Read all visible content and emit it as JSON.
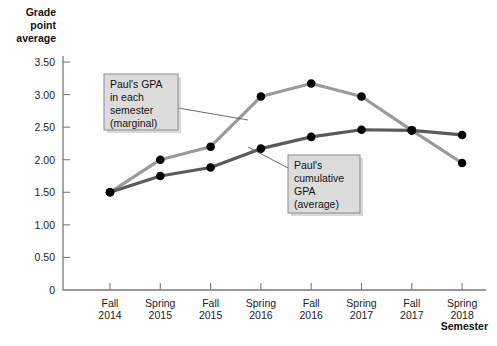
{
  "chart_data": {
    "type": "line",
    "title": "",
    "xlabel": "Semester",
    "ylabel": "Grade point average",
    "ylim": [
      0,
      3.5
    ],
    "yticks": [
      "0",
      "0.50",
      "1.00",
      "1.50",
      "2.00",
      "2.50",
      "3.00",
      "3.50"
    ],
    "ytick_values": [
      0,
      0.5,
      1.0,
      1.5,
      2.0,
      2.5,
      3.0,
      3.5
    ],
    "grid": false,
    "legend_position": "annotations",
    "categories": [
      "Fall 2014",
      "Spring 2015",
      "Fall 2015",
      "Spring 2016",
      "Fall 2016",
      "Spring 2017",
      "Fall 2017",
      "Spring 2018"
    ],
    "category_lines": [
      [
        "Fall",
        "2014"
      ],
      [
        "Spring",
        "2015"
      ],
      [
        "Fall",
        "2015"
      ],
      [
        "Spring",
        "2016"
      ],
      [
        "Fall",
        "2016"
      ],
      [
        "Spring",
        "2017"
      ],
      [
        "Fall",
        "2017"
      ],
      [
        "Spring",
        "2018"
      ]
    ],
    "series": [
      {
        "name": "Paul's GPA in each semester (marginal)",
        "color": "#9a9a9a",
        "values": [
          1.5,
          2.0,
          2.2,
          2.97,
          3.17,
          2.97,
          2.45,
          1.95
        ]
      },
      {
        "name": "Paul's cumulative GPA (average)",
        "color": "#5a5a5a",
        "values": [
          1.5,
          1.75,
          1.88,
          2.17,
          2.35,
          2.46,
          2.45,
          2.38
        ]
      }
    ],
    "annotations": [
      {
        "id": "marginal",
        "lines": [
          "Paul's GPA",
          "in each",
          "semester",
          "(marginal)"
        ],
        "box": {
          "x": 104,
          "y": 74,
          "w": 74,
          "h": 56
        },
        "leader_from": {
          "x": 178,
          "y": 108
        },
        "leader_to": {
          "x": 248,
          "y": 120
        }
      },
      {
        "id": "cumulative",
        "lines": [
          "Paul's",
          "cumulative",
          "GPA",
          "(average)"
        ],
        "box": {
          "x": 288,
          "y": 155,
          "w": 72,
          "h": 58
        },
        "leader_from": {
          "x": 288,
          "y": 168
        },
        "leader_to": {
          "x": 248,
          "y": 147
        }
      }
    ],
    "ylabel_lines": [
      "Grade",
      "point",
      "average"
    ]
  },
  "axis_label_colors": {
    "axis": "#7a7a7a",
    "marker": "#000000",
    "marginal_series": "#9a9a9a",
    "cumulative_series": "#5a5a5a"
  }
}
